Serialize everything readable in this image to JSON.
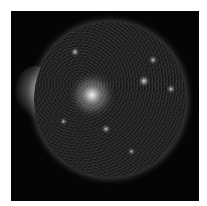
{
  "image": {
    "subject": "Sun (full solar disk, grayscale)",
    "background_color": "#ffffff",
    "frame_color": "#050505"
  },
  "features": {
    "active_region": {
      "cx": 81,
      "cy": 84,
      "r": 11,
      "color": "#f2f2f2"
    },
    "small_spots": [
      {
        "cx": 64,
        "cy": 41,
        "r": 2,
        "color": "#d8d8d8"
      },
      {
        "cx": 133,
        "cy": 70,
        "r": 3,
        "color": "#dddddd"
      },
      {
        "cx": 142,
        "cy": 49,
        "r": 2,
        "color": "#bbbbbb"
      },
      {
        "cx": 160,
        "cy": 78,
        "r": 2,
        "color": "#cccccc"
      },
      {
        "cx": 52,
        "cy": 110,
        "r": 1.5,
        "color": "#bbbbbb"
      },
      {
        "cx": 120,
        "cy": 140,
        "r": 1.5,
        "color": "#aaaaaa"
      },
      {
        "cx": 95,
        "cy": 118,
        "r": 2,
        "color": "#cccccc"
      }
    ]
  }
}
